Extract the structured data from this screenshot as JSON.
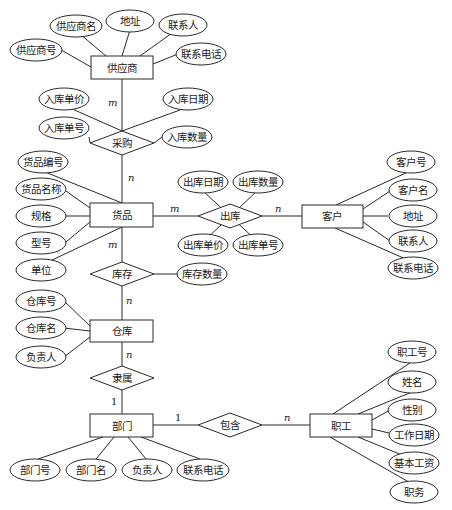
{
  "diagram": {
    "type": "ER diagram",
    "entities": {
      "supplier": {
        "label": "供应商",
        "attributes": [
          "供应商号",
          "供应商名",
          "地址",
          "联系人",
          "联系电话"
        ]
      },
      "goods": {
        "label": "货品",
        "attributes": [
          "货品编号",
          "货品名称",
          "规格",
          "型号",
          "单位"
        ]
      },
      "customer": {
        "label": "客户",
        "attributes": [
          "客户号",
          "客户名",
          "地址",
          "联系人",
          "联系电话"
        ]
      },
      "warehouse": {
        "label": "仓库",
        "attributes": [
          "仓库号",
          "仓库名",
          "负责人"
        ]
      },
      "department": {
        "label": "部门",
        "attributes": [
          "部门号",
          "部门名",
          "负责人",
          "联系电话"
        ]
      },
      "employee": {
        "label": "职工",
        "attributes": [
          "职工号",
          "姓名",
          "性别",
          "工作日期",
          "基本工资",
          "职务"
        ]
      }
    },
    "relationships": {
      "purchase": {
        "label": "采购",
        "attributes": [
          "入库单价",
          "入库日期",
          "入库单号",
          "入库数量"
        ],
        "card_a": "m",
        "card_b": "n"
      },
      "outbound": {
        "label": "出库",
        "attributes": [
          "出库日期",
          "出库数量",
          "出库单价",
          "出库单号"
        ],
        "card_a": "m",
        "card_b": "n"
      },
      "stock": {
        "label": "库存",
        "attributes": [
          "库存数量"
        ],
        "card_a": "m",
        "card_b": "n"
      },
      "belongs": {
        "label": "隶属",
        "attributes": [],
        "card_a": "n",
        "card_b": "1"
      },
      "contains": {
        "label": "包含",
        "attributes": [],
        "card_a": "1",
        "card_b": "n"
      }
    }
  }
}
